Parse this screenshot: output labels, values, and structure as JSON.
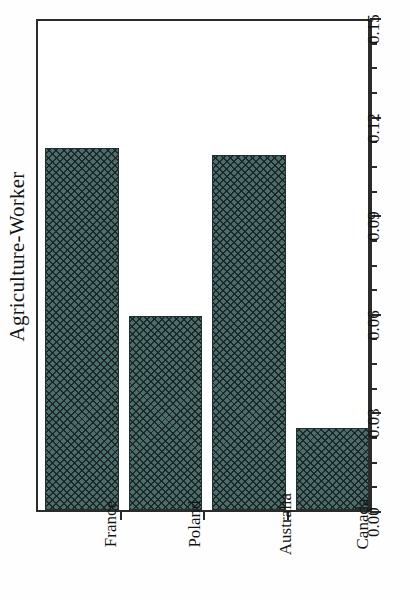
{
  "chart_data": {
    "type": "bar",
    "title": "",
    "subtitle": "",
    "xlabel": "",
    "ylabel": "Agriculture-Worker",
    "categories": [
      "France",
      "Poland",
      "Australia",
      "Canada"
    ],
    "values": [
      0.11,
      0.059,
      0.108,
      0.025
    ],
    "ylim": [
      0.0,
      0.15
    ],
    "ytick_values": [
      0.0,
      0.03,
      0.06,
      0.09,
      0.12,
      0.15
    ],
    "ytick_labels": [
      "0.00",
      "0.03",
      "0.06",
      "0.09",
      "0.12",
      "0.15"
    ],
    "minor_tick_interval": 0.0075,
    "grid": false,
    "legend": null,
    "legend_position": "none",
    "orientation": "vertical",
    "axis_side": "right",
    "bar_color": "#4d6d6c",
    "bar_edge_color": "#23302f",
    "bar_fill_pattern": "cross-hatch",
    "frame_color": "#2b2b2b",
    "background_color": "#ffffff",
    "tick_label_rotation": -90,
    "category_label_rotation": -90,
    "axis_title_rotation": -90
  }
}
